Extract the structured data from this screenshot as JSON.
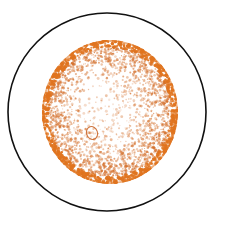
{
  "figure": {
    "title": "Stippled orange spherical specimen in circular field of view",
    "caption": "",
    "width": 234,
    "height": 230,
    "background_color": "#ffffff"
  },
  "chart_data": {
    "type": "scatter",
    "title": "Stippled orange spherical specimen in circular field of view",
    "subtitle": "",
    "xlabel": "",
    "ylabel": "",
    "grid": false,
    "legend": null,
    "xlim": [
      0,
      234
    ],
    "ylim": [
      0,
      230
    ],
    "background_color": "#ffffff",
    "elements": [
      {
        "name": "field-of-view-circle",
        "kind": "circle-outline",
        "cx": 107,
        "cy": 112,
        "r": 99,
        "stroke": "#111111",
        "stroke_width": 1.6,
        "fill": "none"
      },
      {
        "name": "specimen-sphere",
        "kind": "stipple-disc",
        "cx": 110,
        "cy": 112,
        "rx": 68,
        "ry": 72,
        "fill": "#ffffff",
        "dot_color": "#d4702c",
        "rim_color": "#e0741f",
        "dot_count": 5200,
        "dot_size_min": 0.55,
        "dot_size_max": 1.5,
        "highlight": {
          "name": "specular-highlight",
          "cx": 95,
          "cy": 93,
          "r": 30,
          "density": 0.12
        },
        "rim_band": {
          "inner_fraction": 0.9,
          "density_multiplier": 3.1
        }
      },
      {
        "name": "germ-pore-mark",
        "kind": "oval-outline",
        "cx": 92,
        "cy": 133,
        "rx": 5.5,
        "ry": 6.5,
        "rotation_deg": -18,
        "stroke": "#c9662a",
        "stroke_width": 1.1,
        "fill": "none"
      }
    ],
    "colors": {
      "outline": "#111111",
      "stipple": "#d4702c",
      "rim": "#e0741f",
      "pore": "#c9662a",
      "paper": "#ffffff"
    }
  }
}
